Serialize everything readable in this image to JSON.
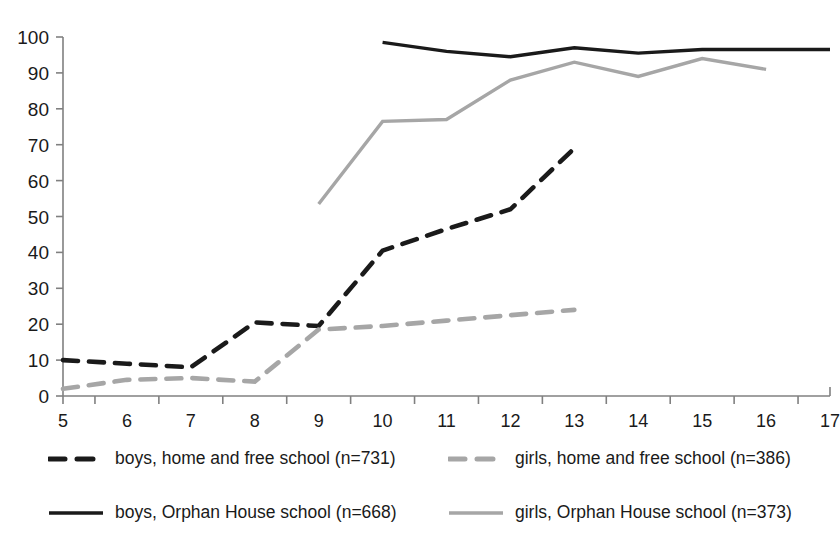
{
  "chart_data": {
    "type": "line",
    "title": "",
    "xlabel": "",
    "ylabel": "",
    "x": [
      5,
      6,
      7,
      8,
      9,
      10,
      11,
      12,
      13,
      14,
      15,
      16,
      17
    ],
    "xlim": [
      5,
      17
    ],
    "ylim": [
      0,
      100
    ],
    "ytick_labels": [
      "0",
      "10",
      "20",
      "30",
      "40",
      "50",
      "60",
      "70",
      "80",
      "90",
      "100"
    ],
    "xtick_labels": [
      "5",
      "6",
      "7",
      "8",
      "9",
      "10",
      "11",
      "12",
      "13",
      "14",
      "15",
      "16",
      "17"
    ],
    "grid": false,
    "legend_position": "bottom",
    "series": [
      {
        "name": "boys, home and free school (n=731)",
        "style": "dashed",
        "color": "#1a1a1a",
        "x": [
          5,
          6,
          7,
          8,
          9,
          10,
          11,
          12,
          13
        ],
        "values": [
          10,
          9,
          8,
          20.5,
          19.5,
          40.5,
          46.5,
          52,
          69
        ]
      },
      {
        "name": "girls, home and free school (n=386)",
        "style": "dashed",
        "color": "#a6a6a6",
        "x": [
          5,
          6,
          7,
          8,
          9,
          10,
          11,
          12,
          13
        ],
        "values": [
          2,
          4.5,
          5,
          4,
          18.5,
          19.5,
          21,
          22.5,
          24
        ]
      },
      {
        "name": "boys, Orphan House school (n=668)",
        "style": "solid",
        "color": "#1a1a1a",
        "x": [
          10,
          11,
          12,
          13,
          14,
          15,
          16,
          17
        ],
        "values": [
          98.5,
          96,
          94.5,
          97,
          95.5,
          96.5,
          96.5,
          96.5
        ]
      },
      {
        "name": "girls, Orphan House school (n=373)",
        "style": "solid",
        "color": "#a6a6a6",
        "x": [
          9,
          10,
          11,
          12,
          13,
          14,
          15,
          16
        ],
        "values": [
          53.5,
          76.5,
          77,
          88,
          93,
          89,
          94,
          91
        ]
      }
    ]
  },
  "legend": {
    "items": [
      {
        "label": "boys, home and free school (n=731)",
        "style": "dashed",
        "color": "#1a1a1a"
      },
      {
        "label": "girls, home and free school (n=386)",
        "style": "dashed",
        "color": "#a6a6a6"
      },
      {
        "label": "boys, Orphan House school (n=668)",
        "style": "solid",
        "color": "#1a1a1a"
      },
      {
        "label": "girls, Orphan House school (n=373)",
        "style": "solid",
        "color": "#a6a6a6"
      }
    ]
  },
  "colors": {
    "axis": "#808080",
    "text": "#1a1a1a",
    "dark_series": "#1a1a1a",
    "light_series": "#a6a6a6",
    "background": "#ffffff"
  }
}
